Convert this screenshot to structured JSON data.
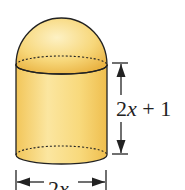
{
  "figure": {
    "height_label": "2x + 1",
    "height_label_parts": {
      "coef": "2",
      "var": "x",
      "rest": " + 1"
    },
    "width_label": "2x",
    "width_label_parts": {
      "coef": "2",
      "var": "x"
    },
    "colors": {
      "fill_light": "#fbe9a8",
      "fill_mid": "#f6d36a",
      "fill_dark": "#e9b53c",
      "outline": "#222222"
    }
  }
}
